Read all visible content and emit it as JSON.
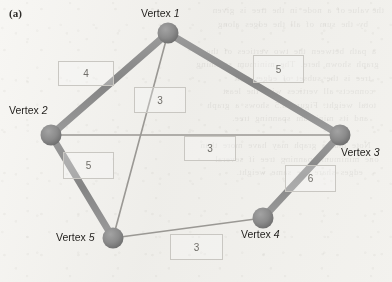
{
  "figure": {
    "panel_label": "(a)",
    "caption_colors": {
      "paper": "#f1f0ed",
      "edge_bold": "#8a8a8a",
      "edge_thin": "#9a9894",
      "node": "#8a8a8a",
      "node_shade": "#6e6e6e",
      "box_border": "#c9c7c2",
      "text": "#262421"
    }
  },
  "graph": {
    "type": "weighted-undirected-graph",
    "nodes": [
      {
        "id": "v1",
        "label_prefix": "Vertex",
        "label_number": "1",
        "label": "Vertex 1",
        "cx": 168,
        "cy": 33,
        "r": 10.5,
        "label_x": 141,
        "label_y": 7
      },
      {
        "id": "v2",
        "label_prefix": "Vertex",
        "label_number": "2",
        "label": "Vertex 2",
        "cx": 51,
        "cy": 135,
        "r": 10.5,
        "label_x": 9,
        "label_y": 104
      },
      {
        "id": "v3",
        "label_prefix": "Vertex",
        "label_number": "3",
        "label": "Vertex 3",
        "cx": 340,
        "cy": 135,
        "r": 10.5,
        "label_x": 341,
        "label_y": 146
      },
      {
        "id": "v4",
        "label_prefix": "Vertex",
        "label_number": "4",
        "label": "Vertex 4",
        "cx": 263,
        "cy": 218,
        "r": 10.5,
        "label_x": 241,
        "label_y": 228
      },
      {
        "id": "v5",
        "label_prefix": "Vertex",
        "label_number": "5",
        "label": "Vertex 5",
        "cx": 113,
        "cy": 238,
        "r": 10.5,
        "label_x": 56,
        "label_y": 231
      }
    ],
    "edges": [
      {
        "id": "e12",
        "from": "v1",
        "to": "v2",
        "weight": "4",
        "emphasis": "bold",
        "width": 7,
        "box_x": 58,
        "box_y": 61,
        "box_w": 56,
        "box_h": 25
      },
      {
        "id": "e13",
        "from": "v1",
        "to": "v3",
        "weight": "5",
        "emphasis": "bold",
        "width": 7,
        "box_x": 253,
        "box_y": 55,
        "box_w": 51,
        "box_h": 28
      },
      {
        "id": "e15",
        "from": "v1",
        "to": "v5",
        "weight": "3",
        "emphasis": "thin",
        "width": 1.6,
        "box_x": 134,
        "box_y": 87,
        "box_w": 52,
        "box_h": 26
      },
      {
        "id": "e23",
        "from": "v2",
        "to": "v3",
        "weight": "3",
        "emphasis": "thin",
        "width": 1.6,
        "box_x": 184,
        "box_y": 136,
        "box_w": 52,
        "box_h": 25
      },
      {
        "id": "e25",
        "from": "v2",
        "to": "v5",
        "weight": "5",
        "emphasis": "bold",
        "width": 7,
        "box_x": 63,
        "box_y": 152,
        "box_w": 51,
        "box_h": 27
      },
      {
        "id": "e34",
        "from": "v3",
        "to": "v4",
        "weight": "6",
        "emphasis": "bold",
        "width": 7,
        "box_x": 285,
        "box_y": 165,
        "box_w": 51,
        "box_h": 27
      },
      {
        "id": "e45",
        "from": "v4",
        "to": "v5",
        "weight": "3",
        "emphasis": "thin",
        "width": 1.6,
        "box_x": 170,
        "box_y": 234,
        "box_w": 53,
        "box_h": 26
      }
    ]
  },
  "background_bleed": {
    "text": "the value of  a  node  in  the  tree  is  given\n      by  the  sum  of  all  the  edges  along\n\n   a  path  between  the  two  vertices  of  the\n  graph  shown  here.  The  minimum  spanning\n     tree  is  the  subset  of  edges  that\n    connects  all  vertices  with  the  least\n   total  weight.  Figure  3.5  shows  a  graph\n      and  its  minimum  spanning  tree.\n\n     Note  that  a  graph  may  have  more  than\n  one  minimum  spanning  tree  if  several\n        edges  share  the  same  weight."
  }
}
